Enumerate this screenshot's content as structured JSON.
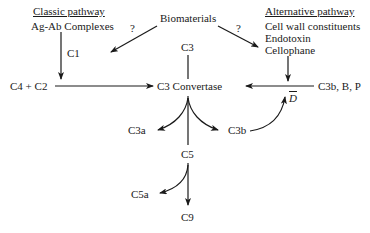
{
  "diagram": {
    "nodes": {
      "classic_heading": "Classic pathway",
      "classic_trigger": "Ag-Ab Complexes",
      "c1": "C1",
      "c4c2": "C4 + C2",
      "biomaterials": "Biomaterials",
      "q_left": "?",
      "q_right": "?",
      "alt_heading": "Alternative pathway",
      "alt_trigger_1": "Cell wall constituents",
      "alt_trigger_2": "Endotoxin",
      "alt_trigger_3": "Cellophane",
      "c3": "C3",
      "c3_convertase": "C3 Convertase",
      "c3b_b_p": "C3b, B, P",
      "d_bar": "D",
      "c3a": "C3a",
      "c3b": "C3b",
      "c5": "C5",
      "c5a": "C5a",
      "c9": "C9"
    },
    "edges": [
      {
        "from": "Ag-Ab Complexes",
        "to": "C4 + C2",
        "label": "C1"
      },
      {
        "from": "C4 + C2",
        "to": "C3 Convertase"
      },
      {
        "from": "Biomaterials",
        "to": "Classic pathway",
        "label": "?"
      },
      {
        "from": "Biomaterials",
        "to": "Alternative pathway",
        "label": "?"
      },
      {
        "from": "Cellophane",
        "to": "C3b, B, P line"
      },
      {
        "from": "C3b, B, P",
        "to": "C3 Convertase"
      },
      {
        "from": "C3",
        "to": "C3 Convertase"
      },
      {
        "from": "C3 Convertase",
        "to": "C3a"
      },
      {
        "from": "C3 Convertase",
        "to": "C3b"
      },
      {
        "from": "C3b",
        "to": "D (feedback)"
      },
      {
        "from": "C5",
        "to": "C3 Convertase"
      },
      {
        "from": "C5",
        "to": "C5a"
      },
      {
        "from": "C5",
        "to": "C9"
      }
    ]
  }
}
